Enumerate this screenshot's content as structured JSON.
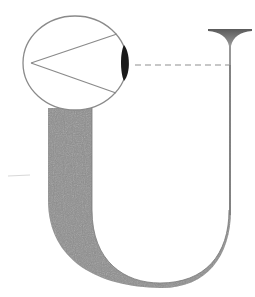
{
  "diagram": {
    "type": "schematic",
    "text_labels": [],
    "colors": {
      "background": "#ffffff",
      "outline": "#8a8a8a",
      "band_fill": "#8e8e8e",
      "lens_fill": "#1a1a1a",
      "funnel_fill": "#7a7a7a",
      "dash": "#9a9a9a"
    },
    "elements": {
      "eye_circle": {
        "cx": 75,
        "cy": 63,
        "rx": 52,
        "ry": 47
      },
      "view_cone": {
        "apex": [
          31,
          63
        ],
        "upper_end": [
          117,
          34
        ],
        "lower_end": [
          116,
          93
        ]
      },
      "lens": {
        "x": 124,
        "top": 45,
        "bottom": 81
      },
      "sight_line": {
        "y": 65,
        "x1": 135,
        "x2": 229,
        "style": "dashed"
      },
      "vertical_rod": {
        "x": 230,
        "top": 30,
        "bottom": 225
      },
      "funnel_top": {
        "left": 208,
        "right": 252,
        "top": 29,
        "tip": 44
      },
      "u_band": {
        "outer_left_x": 48,
        "inner_left_x": 92,
        "top_y": 108,
        "bottom_y": 285,
        "right_x": 230
      }
    }
  }
}
